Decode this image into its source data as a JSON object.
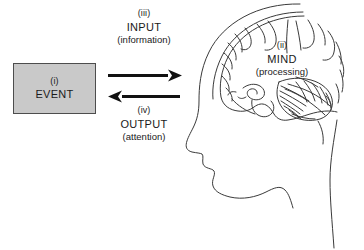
{
  "diagram": {
    "background_color": "#ffffff",
    "line_color": "#333333",
    "box_fill_color": "#c9c9c9",
    "box_border_color": "#4d4d4d",
    "arrow_color": "#111111"
  },
  "event": {
    "marker": "(i)",
    "label": "EVENT"
  },
  "input": {
    "marker": "(iii)",
    "label": "INPUT",
    "sub": "(information)"
  },
  "output": {
    "marker": "(iv)",
    "label": "OUTPUT",
    "sub": "(attention)"
  },
  "mind": {
    "marker": "(ii)",
    "label": "MIND",
    "sub": "(processing)"
  },
  "arrows": [
    {
      "name": "input-arrow",
      "direction": "right",
      "from": "event",
      "to": "mind"
    },
    {
      "name": "output-arrow",
      "direction": "left",
      "from": "mind",
      "to": "event"
    }
  ]
}
